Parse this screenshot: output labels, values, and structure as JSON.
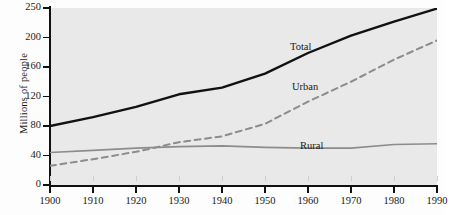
{
  "figure": {
    "background_color": "#e9e9e9",
    "page_color": "#fdfdfd"
  },
  "axes": {
    "ylabel": "Millions of people",
    "xlabel": "",
    "yticks": [
      0,
      40,
      80,
      120,
      160,
      200,
      250
    ],
    "ytick_labels": [
      "0",
      "40",
      "80",
      "120",
      "160",
      "200",
      "250"
    ],
    "xticks": [
      1900,
      1910,
      1920,
      1930,
      1940,
      1950,
      1960,
      1970,
      1980,
      1990
    ],
    "xtick_labels": [
      "1900",
      "1910",
      "1920",
      "1930",
      "1940",
      "1950",
      "1960",
      "1970",
      "1980",
      "1990"
    ]
  },
  "labels": {
    "total": "Total",
    "urban": "Urban",
    "rural": "Rural"
  },
  "colors": {
    "total": "#111111",
    "urban": "#8c8c8c",
    "rural": "#8c8c8c",
    "axis": "#111111",
    "plot_bg": "#e9e9e9"
  },
  "chart_data": {
    "type": "line",
    "title": "",
    "xlabel": "",
    "ylabel": "Millions of people",
    "xlim": [
      1900,
      1990
    ],
    "ylim": [
      0,
      250
    ],
    "grid": false,
    "legend": "inline-annotations",
    "x": [
      1900,
      1910,
      1920,
      1930,
      1940,
      1950,
      1960,
      1970,
      1980,
      1990
    ],
    "series": [
      {
        "name": "Total",
        "style": "solid",
        "color": "#111111",
        "width": 2.4,
        "values": [
          80,
          92,
          106,
          123,
          132,
          151,
          179,
          203,
          227,
          249
        ]
      },
      {
        "name": "Urban",
        "style": "dashed",
        "color": "#8c8c8c",
        "width": 2.0,
        "values": [
          26,
          35,
          45,
          58,
          66,
          83,
          113,
          140,
          170,
          196
        ]
      },
      {
        "name": "Rural",
        "style": "solid",
        "color": "#8c8c8c",
        "width": 1.6,
        "values": [
          44,
          47,
          50,
          52,
          53,
          51,
          50,
          50,
          55,
          56
        ]
      }
    ]
  }
}
